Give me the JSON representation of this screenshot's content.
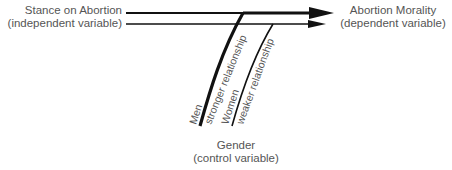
{
  "diagram": {
    "independent_variable": {
      "line1": "Stance on Abortion",
      "line2": "(independent variable)"
    },
    "dependent_variable": {
      "line1": "Abortion Morality",
      "line2": "(dependent variable)"
    },
    "control_variable": {
      "line1": "Gender",
      "line2": "(control variable)"
    },
    "branches": [
      {
        "group": "Men",
        "relationship": "stronger relationship"
      },
      {
        "group": "Women",
        "relationship": "weaker relationship"
      }
    ],
    "colors": {
      "line": "#111111",
      "text": "#555555"
    }
  }
}
